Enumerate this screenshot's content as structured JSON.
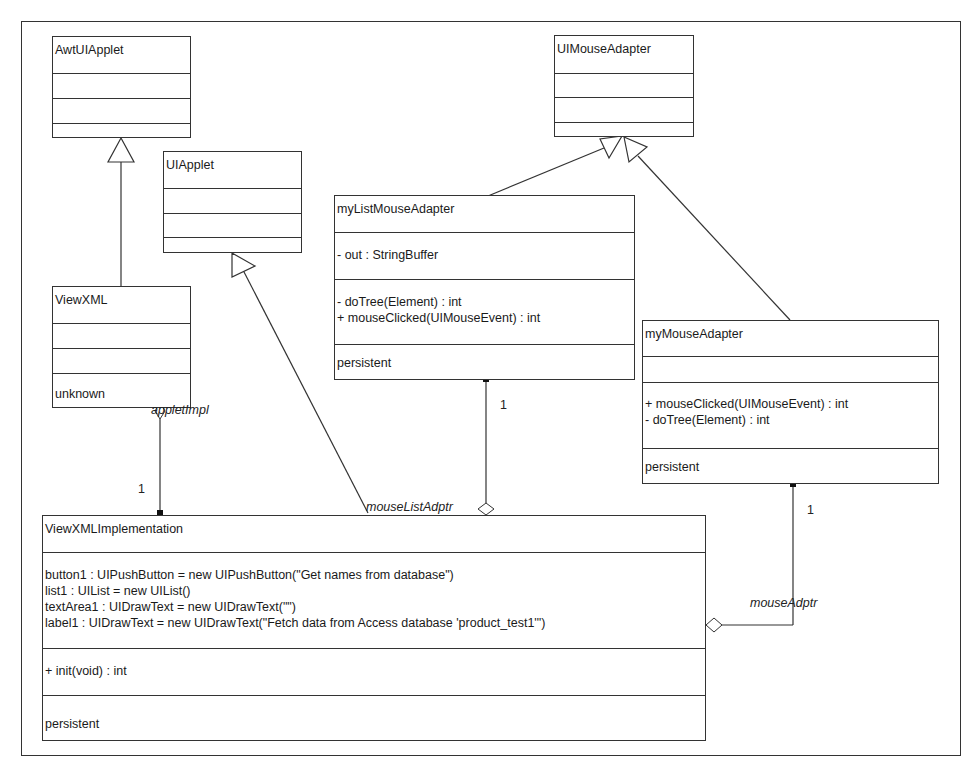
{
  "diagram": {
    "type": "UML class diagram",
    "classes": {
      "awt_ui_applet": {
        "name": "AwtUIApplet",
        "attributes": [],
        "operations": [],
        "footer": ""
      },
      "ui_mouse_adapter": {
        "name": "UIMouseAdapter",
        "attributes": [],
        "operations": [],
        "footer": ""
      },
      "ui_applet": {
        "name": "UIApplet",
        "attributes": [],
        "operations": [],
        "footer": ""
      },
      "my_list_mouse_adapter": {
        "name": "myListMouseAdapter",
        "attributes": [
          "- out : StringBuffer"
        ],
        "operations": [
          "- doTree(Element) : int",
          "+ mouseClicked(UIMouseEvent) : int"
        ],
        "footer": "persistent"
      },
      "view_xml": {
        "name": "ViewXML",
        "attributes": [],
        "operations": [],
        "footer": "unknown"
      },
      "my_mouse_adapter": {
        "name": "myMouseAdapter",
        "attributes": [],
        "operations": [
          "+ mouseClicked(UIMouseEvent) : int",
          "- doTree(Element) : int"
        ],
        "footer": "persistent"
      },
      "view_xml_implementation": {
        "name": "ViewXMLImplementation",
        "attributes": [
          "button1 : UIPushButton = new UIPushButton(\"Get names from database\")",
          "list1 : UIList = new UIList()",
          "textArea1 : UIDrawText = new UIDrawText(\"\")",
          "label1 : UIDrawText = new UIDrawText(\"Fetch data from Access database 'product_test1'\")"
        ],
        "operations": [
          "+ init(void) : int"
        ],
        "footer": "persistent"
      }
    },
    "relationships": {
      "generalizations": [
        {
          "from": "ViewXML",
          "to": "AwtUIApplet"
        },
        {
          "from": "ViewXMLImplementation",
          "to": "UIApplet"
        },
        {
          "from": "myListMouseAdapter",
          "to": "UIMouseAdapter"
        },
        {
          "from": "myMouseAdapter",
          "to": "UIMouseAdapter"
        }
      ],
      "associations": [
        {
          "role": "appletImpl",
          "multiplicity": "1",
          "from": "ViewXML",
          "to": "ViewXMLImplementation"
        },
        {
          "role": "mouseListAdptr",
          "multiplicity": "1",
          "from": "ViewXMLImplementation",
          "to": "myListMouseAdapter"
        },
        {
          "role": "mouseAdptr",
          "multiplicity": "1",
          "from": "ViewXMLImplementation",
          "to": "myMouseAdapter"
        }
      ]
    }
  }
}
